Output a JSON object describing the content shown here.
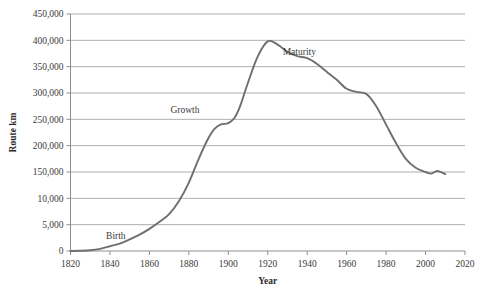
{
  "chart_data": {
    "type": "line",
    "title": "",
    "xlabel": "Year",
    "ylabel": "Route km",
    "xlim": [
      1820,
      2020
    ],
    "ylim": [
      0,
      450000
    ],
    "grid": true,
    "legend_position": "none",
    "xticks": [
      "1820",
      "1840",
      "1860",
      "1880",
      "1900",
      "1920",
      "1940",
      "1960",
      "1980",
      "2000",
      "2020"
    ],
    "xtick_values": [
      1820,
      1840,
      1860,
      1880,
      1900,
      1920,
      1940,
      1960,
      1980,
      2000,
      2020
    ],
    "yticks": [
      "0",
      "5,000",
      "10,000",
      "150,000",
      "200,000",
      "250,000",
      "300,000",
      "350,000",
      "400,000",
      "450,000"
    ],
    "ytick_values": [
      0,
      50000,
      100000,
      150000,
      200000,
      250000,
      300000,
      350000,
      400000,
      450000
    ],
    "series": [
      {
        "name": "Route km",
        "x": [
          1820,
          1825,
          1830,
          1835,
          1840,
          1845,
          1850,
          1855,
          1860,
          1865,
          1870,
          1875,
          1880,
          1885,
          1890,
          1893,
          1896,
          1900,
          1903,
          1906,
          1910,
          1915,
          1920,
          1925,
          1930,
          1935,
          1940,
          1945,
          1950,
          1955,
          1960,
          1965,
          1970,
          1975,
          1980,
          1985,
          1990,
          1995,
          2000,
          2003,
          2006,
          2010
        ],
        "y": [
          0,
          500,
          1500,
          4000,
          9000,
          14000,
          22000,
          31000,
          42000,
          55000,
          70000,
          95000,
          130000,
          175000,
          215000,
          232000,
          240000,
          243000,
          252000,
          275000,
          320000,
          370000,
          398000,
          392000,
          378000,
          370000,
          366000,
          355000,
          340000,
          325000,
          308000,
          302000,
          298000,
          275000,
          240000,
          205000,
          175000,
          158000,
          150000,
          147000,
          152000,
          146000
        ]
      }
    ],
    "annotations": [
      {
        "text": "Birth",
        "x": 1843,
        "y": 22000
      },
      {
        "text": "Growth",
        "x": 1878,
        "y": 262000
      },
      {
        "text": "Maturity",
        "x": 1936,
        "y": 372000
      }
    ],
    "colors": {
      "line": "#6e6e6e",
      "grid": "#9a9a9a",
      "axis": "#8f8f8f",
      "text": "#3a3a3a",
      "background": "#ffffff"
    }
  }
}
